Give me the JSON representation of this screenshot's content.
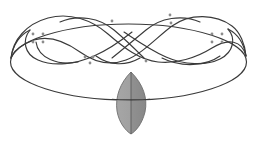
{
  "figure": {
    "type": "knot-diagram",
    "canvas": {
      "width": 257,
      "height": 143,
      "background": "#ffffff"
    },
    "colors": {
      "strand": "#3a3a3a",
      "lens_fill_left": "#a2a2a2",
      "lens_fill_right": "#8f8f8f",
      "lens_stroke": "#6e6e6e",
      "dot": "#8c8c8c",
      "background": "#ffffff"
    },
    "stroke_width": 1.15
  },
  "outer_loop": {
    "name": "outer-closure-ellipse",
    "label": "outer closure loop",
    "cx": 128.5,
    "cy": 62,
    "rx": 118,
    "ry": 38,
    "bottom_y": 100
  },
  "braid": {
    "label": "three-strand braid region",
    "strand_count": 3,
    "crossing_count": 6,
    "x_start": 20,
    "x_end": 238,
    "y_top": 12,
    "y_bottom": 62,
    "strands": [
      {
        "name": "strand-upper-wave",
        "path": "M 22,48 C 26,22 52,10 76,12 C 100,14 116,34 134,48 C 152,62 172,66 192,58 C 212,50 228,34 236,44"
      },
      {
        "name": "strand-lower-wave",
        "path": "M 22,48 C 30,62 52,66 72,58 C 92,50 110,26 132,14 C 152,4 178,10 194,26 C 208,40 224,52 236,44"
      },
      {
        "name": "strand-left-lobe-lower",
        "path": "M 38,36 C 34,54 48,64 68,62 C 90,60 106,52 118,44"
      },
      {
        "name": "strand-right-lobe-upper",
        "path": "M 140,44 C 156,54 176,60 196,60 C 216,60 226,50 224,36"
      },
      {
        "name": "strand-center-left-arc",
        "path": "M 44,30 C 56,16 80,14 98,26 C 112,36 122,46 132,54"
      },
      {
        "name": "strand-center-right-arc",
        "path": "M 126,54 C 138,46 150,36 164,26 C 182,14 206,16 218,30"
      }
    ]
  },
  "crossings": [
    {
      "name": "crossing-1",
      "x": 36,
      "y": 36,
      "dots": [
        [
          32,
          33
        ],
        [
          42,
          33
        ],
        [
          32,
          41
        ],
        [
          42,
          41
        ]
      ]
    },
    {
      "name": "crossing-2",
      "x": 89,
      "y": 58,
      "dots": [
        [
          85,
          56
        ],
        [
          93,
          56
        ],
        [
          89,
          62
        ]
      ]
    },
    {
      "name": "crossing-3",
      "x": 112,
      "y": 20,
      "dots": [
        [
          112,
          20
        ]
      ]
    },
    {
      "name": "crossing-4",
      "x": 146,
      "y": 60,
      "dots": [
        [
          146,
          60
        ]
      ]
    },
    {
      "name": "crossing-5",
      "x": 170,
      "y": 16,
      "dots": [
        [
          170,
          14
        ],
        [
          170,
          22
        ]
      ]
    },
    {
      "name": "crossing-6",
      "x": 215,
      "y": 36,
      "dots": [
        [
          211,
          33
        ],
        [
          221,
          33
        ],
        [
          211,
          41
        ],
        [
          221,
          41
        ]
      ]
    }
  ],
  "lens": {
    "name": "shaded-lens-disk",
    "label": "shaded lens (vesica) disk",
    "center_x": 131,
    "center_y": 103,
    "top_y": 72,
    "bottom_y": 134,
    "half_width": 16,
    "axis_label": "vertical axis",
    "crossed_by": "outer-closure-ellipse"
  },
  "accessibility": {
    "alt_text": "A knot diagram: a large horizontal closure ellipse with a three-strand braid woven across its upper half, small gray dots marking crossing points, and a shaded gray lens-shaped disk with a vertical axis crossing the ellipse at the bottom center."
  }
}
